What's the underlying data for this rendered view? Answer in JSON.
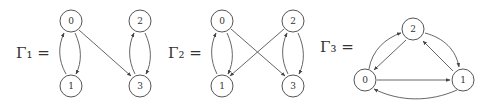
{
  "graphs": [
    {
      "label": "Γ₁ =",
      "nodes": [
        {
          "id": "0",
          "label": "0"
        },
        {
          "id": "1",
          "label": "1"
        },
        {
          "id": "2",
          "label": "2"
        },
        {
          "id": "3",
          "label": "3"
        }
      ],
      "edges": [
        {
          "from": "0",
          "to": "1"
        },
        {
          "from": "1",
          "to": "0"
        },
        {
          "from": "0",
          "to": "3"
        },
        {
          "from": "2",
          "to": "3"
        },
        {
          "from": "3",
          "to": "2"
        }
      ]
    },
    {
      "label": "Γ₂ =",
      "nodes": [
        {
          "id": "0",
          "label": "0"
        },
        {
          "id": "1",
          "label": "1"
        },
        {
          "id": "2",
          "label": "2"
        },
        {
          "id": "3",
          "label": "3"
        }
      ],
      "edges": [
        {
          "from": "0",
          "to": "1"
        },
        {
          "from": "1",
          "to": "0"
        },
        {
          "from": "0",
          "to": "3"
        },
        {
          "from": "2",
          "to": "1"
        },
        {
          "from": "2",
          "to": "3"
        },
        {
          "from": "3",
          "to": "2"
        }
      ]
    },
    {
      "label": "Γ₃ =",
      "nodes": [
        {
          "id": "0",
          "label": "0"
        },
        {
          "id": "1",
          "label": "1"
        },
        {
          "id": "2",
          "label": "2"
        }
      ],
      "edges": [
        {
          "from": "0",
          "to": "2"
        },
        {
          "from": "2",
          "to": "0"
        },
        {
          "from": "2",
          "to": "1"
        },
        {
          "from": "1",
          "to": "2"
        },
        {
          "from": "0",
          "to": "1"
        },
        {
          "from": "1",
          "to": "0"
        }
      ]
    }
  ]
}
